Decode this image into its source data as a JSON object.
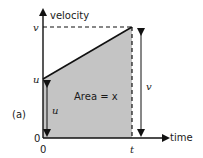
{
  "figure": {
    "panel_label": "(a)",
    "y_axis_label": "velocity",
    "x_axis_label": "time",
    "y_ticks": {
      "v": "v",
      "u": "u",
      "zero": "0"
    },
    "x_ticks": {
      "zero": "0",
      "t": "t"
    },
    "area_label": "Area = x",
    "u_arrow_label": "u",
    "v_arrow_label": "v",
    "colors": {
      "fill": "#c4c4c4",
      "line": "#111111"
    }
  }
}
